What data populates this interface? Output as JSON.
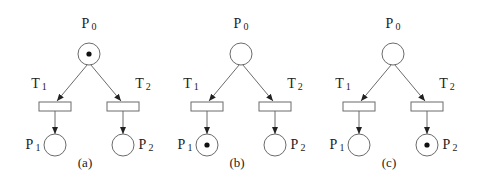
{
  "figure": {
    "panels": [
      {
        "caption": "(a)",
        "center_x": 89,
        "places": [
          {
            "name": "P",
            "sub": "0",
            "tokens": 1
          },
          {
            "name": "P",
            "sub": "1",
            "tokens": 0
          },
          {
            "name": "P",
            "sub": "2",
            "tokens": 0
          }
        ],
        "transitions": [
          {
            "name": "T",
            "sub": "1"
          },
          {
            "name": "T",
            "sub": "2"
          }
        ]
      },
      {
        "caption": "(b)",
        "center_x": 241,
        "places": [
          {
            "name": "P",
            "sub": "0",
            "tokens": 0
          },
          {
            "name": "P",
            "sub": "1",
            "tokens": 1
          },
          {
            "name": "P",
            "sub": "2",
            "tokens": 0
          }
        ],
        "transitions": [
          {
            "name": "T",
            "sub": "1"
          },
          {
            "name": "T",
            "sub": "2"
          }
        ]
      },
      {
        "caption": "(c)",
        "center_x": 393,
        "places": [
          {
            "name": "P",
            "sub": "0",
            "tokens": 0
          },
          {
            "name": "P",
            "sub": "1",
            "tokens": 0
          },
          {
            "name": "P",
            "sub": "2",
            "tokens": 1
          }
        ],
        "transitions": [
          {
            "name": "T",
            "sub": "1"
          },
          {
            "name": "T",
            "sub": "2"
          }
        ]
      }
    ],
    "colors": {
      "stroke": "#6b6b6b",
      "token": "#111111",
      "text": "#222222"
    }
  }
}
